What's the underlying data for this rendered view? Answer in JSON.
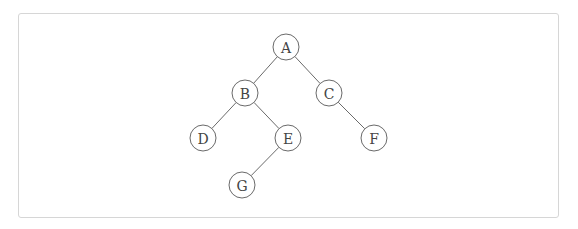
{
  "diagram": {
    "type": "binary-tree",
    "nodes": [
      {
        "id": "A",
        "label": "A"
      },
      {
        "id": "B",
        "label": "B"
      },
      {
        "id": "C",
        "label": "C"
      },
      {
        "id": "D",
        "label": "D"
      },
      {
        "id": "E",
        "label": "E"
      },
      {
        "id": "F",
        "label": "F"
      },
      {
        "id": "G",
        "label": "G"
      }
    ],
    "edges": [
      {
        "from": "A",
        "to": "B",
        "side": "left"
      },
      {
        "from": "A",
        "to": "C",
        "side": "right"
      },
      {
        "from": "B",
        "to": "D",
        "side": "left"
      },
      {
        "from": "B",
        "to": "E",
        "side": "right"
      },
      {
        "from": "C",
        "to": "F",
        "side": "right"
      },
      {
        "from": "E",
        "to": "G",
        "side": "left"
      }
    ],
    "colors": {
      "stroke": "#6a6a6a",
      "label": "#444444",
      "frame_border": "#d6d6d6"
    }
  }
}
